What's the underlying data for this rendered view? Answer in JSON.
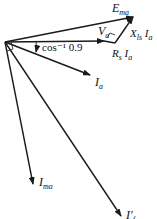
{
  "diagram": {
    "type": "phasor-diagram",
    "labels": {
      "e_ma": {
        "main": "E",
        "sub": "ma"
      },
      "v_a": {
        "main": "V",
        "sub": "a"
      },
      "x_ls_ia": {
        "main": "X",
        "sub": "ls",
        "tail": "I",
        "tail_sub": "a"
      },
      "rs_ia": {
        "main": "R",
        "sub": "s",
        "tail": "I",
        "tail_sub": "a"
      },
      "angle": "cos⁻¹ 0.9",
      "i_a": {
        "main": "I",
        "sub": "a"
      },
      "i_ma": {
        "main": "I",
        "sub": "ma"
      },
      "i_f": {
        "main": "I′",
        "sub": "f"
      }
    },
    "colors": {
      "stroke": "#1a1a1a",
      "background": "#ffffff"
    }
  }
}
